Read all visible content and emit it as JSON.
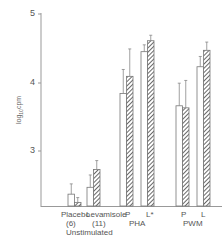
{
  "chart_data": {
    "type": "bar",
    "title": "",
    "xlabel": "",
    "ylabel": "log10 cpm",
    "ylim": [
      2.2,
      5.0
    ],
    "yticks": [
      3,
      4,
      5
    ],
    "grid": false,
    "legend": null,
    "bar_styles": [
      "open (white)",
      "hatched"
    ],
    "categories": [
      "Placebo (6)",
      "Levamisole (11)",
      "PHA P",
      "PHA L*",
      "PWM P",
      "PWM L"
    ],
    "groups": [
      {
        "label": "Placebo",
        "sub": "(6)",
        "group": "Unstimulated"
      },
      {
        "label": "Levamisole",
        "sub": "(11)",
        "group": "Unstimulated"
      },
      {
        "label": "P",
        "group": "PHA"
      },
      {
        "label": "L*",
        "group": "PHA"
      },
      {
        "label": "P",
        "group": "PWM"
      },
      {
        "label": "L",
        "group": "PWM"
      }
    ],
    "series": [
      {
        "name": "open",
        "values": [
          2.37,
          2.47,
          3.84,
          4.45,
          3.66,
          4.23
        ],
        "errors": [
          0.15,
          0.18,
          0.35,
          0.1,
          0.33,
          0.15
        ]
      },
      {
        "name": "hatched",
        "values": [
          2.25,
          2.73,
          4.09,
          4.61,
          3.63,
          4.47
        ],
        "errors": [
          0.07,
          0.13,
          0.4,
          0.08,
          0.4,
          0.12
        ]
      }
    ]
  },
  "axis": {
    "tick_labels": [
      "5",
      "4",
      "3"
    ],
    "ylabel": "log",
    "ylabel_sub": "10",
    "ylabel_rest": "cpm"
  },
  "labels": {
    "placebo": "Placebo",
    "placebo_n": "(6)",
    "levamisole": "Levamisole",
    "levamisole_n": "(11)",
    "unstimulated": "Unstimulated",
    "pha_p": "P",
    "pha_l": "L*",
    "pha": "PHA",
    "pwm_p": "P",
    "pwm_l": "L",
    "pwm": "PWM"
  }
}
